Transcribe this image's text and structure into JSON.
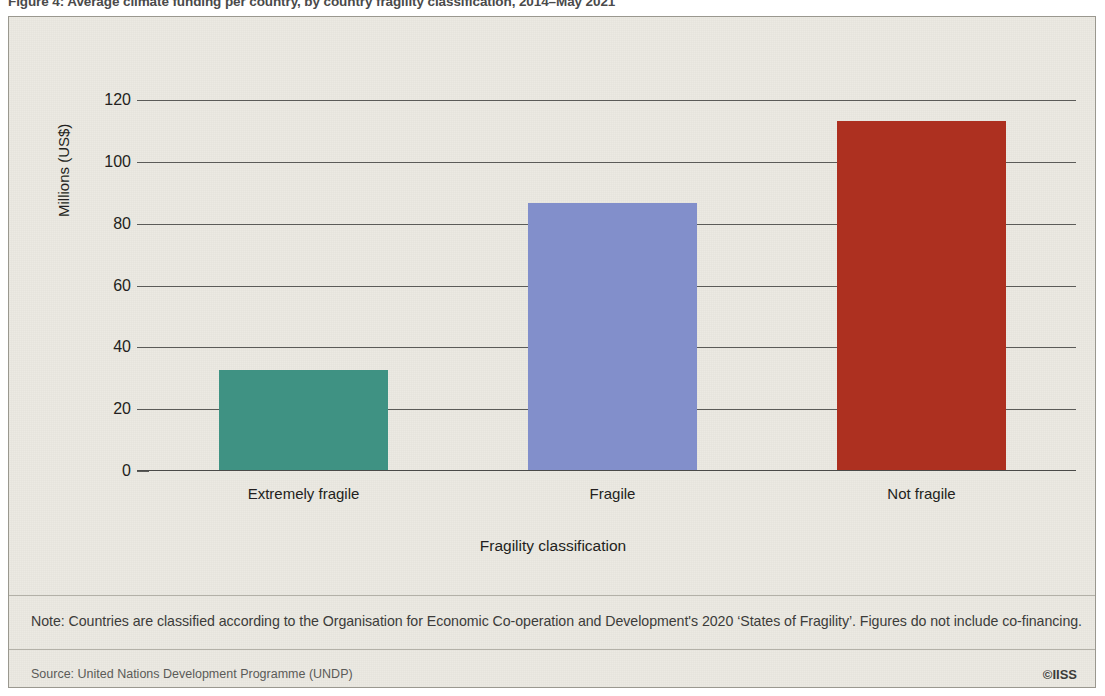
{
  "figure": {
    "caption": "Figure 4: Average climate funding per country, by country fragility classification, 2014–May 2021"
  },
  "chart_data": {
    "type": "bar",
    "title": "Figure 4: Average climate funding per country, by country fragility classification, 2014–May 2021",
    "categories": [
      "Extremely fragile",
      "Fragile",
      "Not fragile"
    ],
    "values": [
      32.5,
      86.5,
      113
    ],
    "series": [
      {
        "name": "Average climate funding per country",
        "values": [
          32.5,
          86.5,
          113
        ]
      }
    ],
    "colors": [
      "#3f9283",
      "#828fcb",
      "#ad3020"
    ],
    "xlabel": "Fragility classification",
    "ylabel": "Millions (US$)",
    "ylim": [
      0,
      120
    ],
    "yticks": [
      0,
      20,
      40,
      60,
      80,
      100,
      120
    ],
    "ytick_labels": [
      "0",
      "20",
      "40",
      "60",
      "80",
      "100",
      "120"
    ],
    "grid": true,
    "legend": "none"
  },
  "axes": {
    "y_title": "Millions (US$)",
    "x_title": "Fragility classification"
  },
  "footer": {
    "note": "Note: Countries are classified according to the Organisation for Economic Co-operation and Development's 2020 ‘States of Fragility’. Figures do not include co-financing.",
    "source": "Source: United Nations Development Programme (UNDP)",
    "logo": "©IISS"
  }
}
